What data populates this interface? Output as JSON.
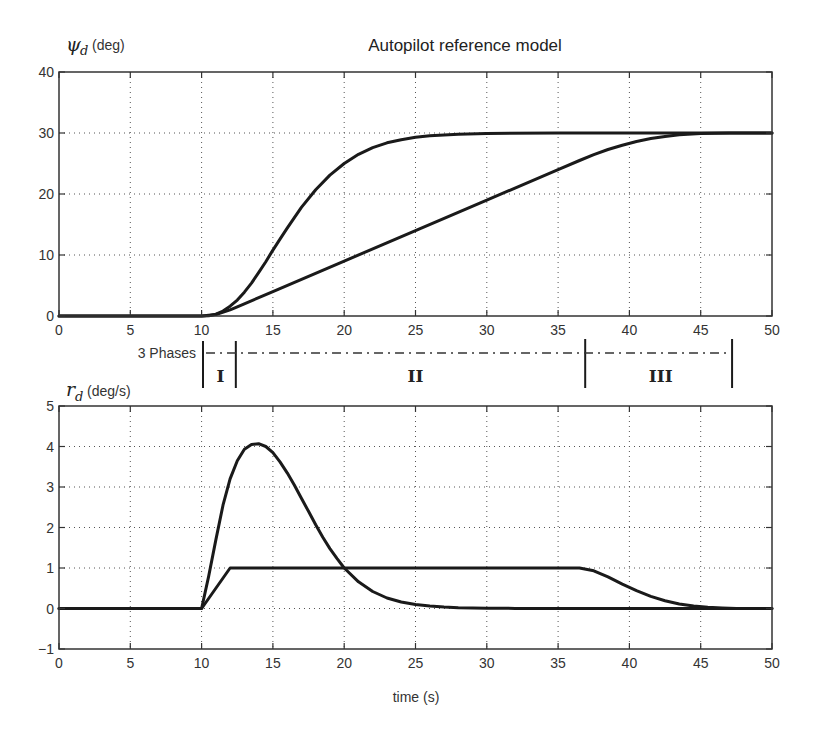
{
  "chart_data": [
    {
      "type": "line",
      "title": "Autopilot reference model",
      "ylabel": {
        "symbol": "ψ",
        "subscript": "d",
        "unit": "(deg)"
      },
      "xlabel": "",
      "xlim": [
        0,
        50
      ],
      "ylim": [
        0,
        40
      ],
      "xticks": [
        0,
        5,
        10,
        15,
        20,
        25,
        30,
        35,
        40,
        45,
        50
      ],
      "yticks": [
        0,
        10,
        20,
        30,
        40
      ],
      "grid": true,
      "series": [
        {
          "name": "psi_d (mass-damper-spring reference)",
          "x": [
            0,
            10,
            10.5,
            11,
            11.5,
            12,
            12.5,
            13,
            13.5,
            14,
            14.5,
            15,
            15.5,
            16,
            17,
            18,
            19,
            20,
            21,
            22,
            23,
            24,
            25,
            26,
            28,
            30,
            35,
            40,
            45,
            50
          ],
          "y": [
            0,
            0,
            0.05,
            0.3,
            0.8,
            1.6,
            2.6,
            3.9,
            5.4,
            7.1,
            8.9,
            10.8,
            12.6,
            14.4,
            17.8,
            20.7,
            23.1,
            25.0,
            26.5,
            27.6,
            28.4,
            28.9,
            29.3,
            29.55,
            29.8,
            29.92,
            30,
            30,
            30,
            30
          ]
        },
        {
          "name": "psi_d (rate-limited reference)",
          "x": [
            0,
            10,
            11,
            12,
            12.5,
            15,
            20,
            25,
            30,
            35,
            36.5,
            37.5,
            38.5,
            39.5,
            40.5,
            41.5,
            42.5,
            43.5,
            45,
            47,
            50
          ],
          "y": [
            0,
            0,
            0.25,
            1.0,
            1.5,
            4.0,
            9.0,
            14.0,
            19.0,
            24.0,
            25.5,
            26.45,
            27.3,
            28.0,
            28.6,
            29.1,
            29.45,
            29.7,
            29.9,
            30,
            30
          ]
        }
      ]
    },
    {
      "type": "line",
      "title": "",
      "ylabel": {
        "symbol": "r",
        "subscript": "d",
        "unit": "(deg/s)"
      },
      "xlabel": "time (s)",
      "xlim": [
        0,
        50
      ],
      "ylim": [
        -1,
        5
      ],
      "xticks": [
        0,
        5,
        10,
        15,
        20,
        25,
        30,
        35,
        40,
        45,
        50
      ],
      "yticks": [
        -1,
        0,
        1,
        2,
        3,
        4,
        5
      ],
      "grid": true,
      "series": [
        {
          "name": "r_d (mass-damper-spring reference)",
          "x": [
            0,
            10,
            10.5,
            11,
            11.5,
            12,
            12.5,
            13,
            13.5,
            14,
            14.5,
            15,
            15.5,
            16,
            16.5,
            17,
            17.5,
            18,
            18.5,
            19,
            19.5,
            20,
            21,
            22,
            23,
            24,
            25,
            26,
            27,
            28,
            30,
            32,
            35,
            40,
            50
          ],
          "y": [
            0,
            0,
            0.8,
            1.7,
            2.55,
            3.2,
            3.65,
            3.93,
            4.05,
            4.07,
            4.0,
            3.85,
            3.62,
            3.35,
            3.05,
            2.72,
            2.4,
            2.07,
            1.76,
            1.48,
            1.23,
            1.0,
            0.66,
            0.42,
            0.26,
            0.16,
            0.1,
            0.06,
            0.035,
            0.02,
            0.008,
            0.003,
            0,
            0,
            0
          ]
        },
        {
          "name": "r_d (rate-limited reference)",
          "x": [
            0,
            10,
            12,
            36.5,
            37.5,
            38.5,
            39.5,
            40.5,
            41.5,
            42.5,
            43.5,
            44.5,
            45.5,
            46.5,
            47.5,
            50
          ],
          "y": [
            0,
            0,
            1,
            1,
            0.93,
            0.78,
            0.6,
            0.44,
            0.3,
            0.19,
            0.11,
            0.06,
            0.03,
            0.012,
            0.003,
            0
          ]
        }
      ]
    }
  ],
  "phases": {
    "label": "3 Phases",
    "boundaries": [
      10.1,
      12.4,
      36.9,
      47.2
    ],
    "names": [
      "I",
      "II",
      "III"
    ]
  },
  "axes_text": {
    "top_title": "Autopilot reference model",
    "top_ylabel_symbol": "ψ",
    "top_ylabel_sub": "d",
    "top_ylabel_unit": "(deg)",
    "bottom_ylabel_symbol": "r",
    "bottom_ylabel_sub": "d",
    "bottom_ylabel_unit": "(deg/s)",
    "xlabel": "time (s)"
  },
  "colors": {
    "line": "#1a1a1a",
    "axis": "#333333",
    "grid": "#555555",
    "background": "#ffffff"
  }
}
